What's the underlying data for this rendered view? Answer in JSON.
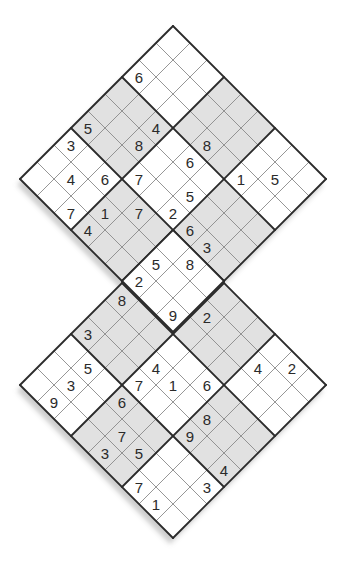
{
  "puzzle": {
    "type": "twin diagonal sudoku (two 9x9 grids rotated 45°, sharing one 3x3 box)",
    "colors": {
      "background": "#ffffff",
      "shaded_box": "#e1e1e1",
      "white_box": "#ffffff",
      "thin_line": "#8a8a8a",
      "thick_line": "#2b2b2b",
      "digit": "#2a2a2a",
      "shadow": "#c4c4c4"
    },
    "shaded_boxes": [
      [
        0,
        1
      ],
      [
        1,
        0
      ],
      [
        1,
        2
      ],
      [
        2,
        1
      ]
    ],
    "grids": [
      {
        "name": "top-grid",
        "top_corner": [
          173,
          26
        ],
        "givens": [
          {
            "r": 1,
            "c": 7,
            "v": "5"
          },
          {
            "r": 2,
            "c": 0,
            "v": "6"
          },
          {
            "r": 2,
            "c": 4,
            "v": "8"
          },
          {
            "r": 2,
            "c": 6,
            "v": "1"
          },
          {
            "r": 3,
            "c": 2,
            "v": "4"
          },
          {
            "r": 3,
            "c": 4,
            "v": "6"
          },
          {
            "r": 4,
            "c": 2,
            "v": "8"
          },
          {
            "r": 4,
            "c": 5,
            "v": "5"
          },
          {
            "r": 5,
            "c": 0,
            "v": "5"
          },
          {
            "r": 5,
            "c": 3,
            "v": "7"
          },
          {
            "r": 5,
            "c": 5,
            "v": "2"
          },
          {
            "r": 5,
            "c": 6,
            "v": "6"
          },
          {
            "r": 5,
            "c": 7,
            "v": "3"
          },
          {
            "r": 6,
            "c": 0,
            "v": "3"
          },
          {
            "r": 6,
            "c": 2,
            "v": "6"
          },
          {
            "r": 6,
            "c": 4,
            "v": "7"
          },
          {
            "r": 6,
            "c": 7,
            "v": "8"
          },
          {
            "r": 7,
            "c": 1,
            "v": "4"
          },
          {
            "r": 7,
            "c": 3,
            "v": "1"
          },
          {
            "r": 7,
            "c": 6,
            "v": "5"
          },
          {
            "r": 8,
            "c": 2,
            "v": "7"
          },
          {
            "r": 8,
            "c": 3,
            "v": "4"
          },
          {
            "r": 8,
            "c": 6,
            "v": "2"
          },
          {
            "r": 8,
            "c": 8,
            "v": "9"
          }
        ]
      },
      {
        "name": "bottom-grid",
        "top_corner": [
          173,
          232
        ],
        "givens": [
          {
            "r": 0,
            "c": 7,
            "v": "2"
          },
          {
            "r": 1,
            "c": 3,
            "v": "2"
          },
          {
            "r": 1,
            "c": 6,
            "v": "4"
          },
          {
            "r": 3,
            "c": 0,
            "v": "8"
          },
          {
            "r": 3,
            "c": 5,
            "v": "6"
          },
          {
            "r": 4,
            "c": 3,
            "v": "4"
          },
          {
            "r": 4,
            "c": 4,
            "v": "1"
          },
          {
            "r": 4,
            "c": 6,
            "v": "8"
          },
          {
            "r": 5,
            "c": 0,
            "v": "3"
          },
          {
            "r": 5,
            "c": 3,
            "v": "7"
          },
          {
            "r": 5,
            "c": 6,
            "v": "9"
          },
          {
            "r": 5,
            "c": 8,
            "v": "4"
          },
          {
            "r": 6,
            "c": 1,
            "v": "5"
          },
          {
            "r": 6,
            "c": 3,
            "v": "6"
          },
          {
            "r": 6,
            "c": 8,
            "v": "3"
          },
          {
            "r": 7,
            "c": 1,
            "v": "3"
          },
          {
            "r": 7,
            "c": 4,
            "v": "7"
          },
          {
            "r": 7,
            "c": 5,
            "v": "5"
          },
          {
            "r": 8,
            "c": 1,
            "v": "9"
          },
          {
            "r": 8,
            "c": 4,
            "v": "3"
          },
          {
            "r": 8,
            "c": 6,
            "v": "7"
          },
          {
            "r": 8,
            "c": 7,
            "v": "1"
          }
        ]
      }
    ],
    "cell_step_px": 17
  }
}
